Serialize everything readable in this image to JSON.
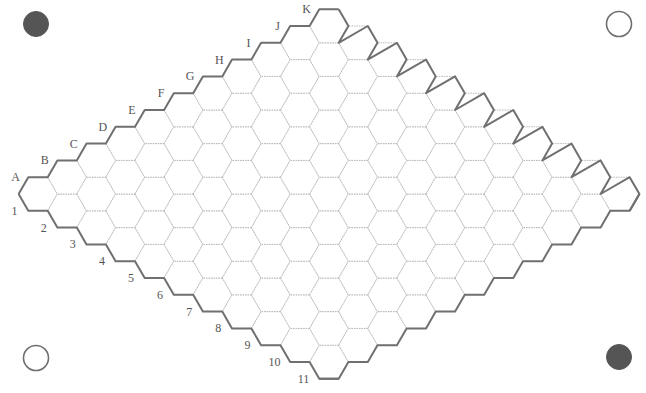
{
  "game": "Hex",
  "board": {
    "size": 11,
    "letters": [
      "A",
      "B",
      "C",
      "D",
      "E",
      "F",
      "G",
      "H",
      "I",
      "J",
      "K"
    ],
    "numbers": [
      "1",
      "2",
      "3",
      "4",
      "5",
      "6",
      "7",
      "8",
      "9",
      "10",
      "11"
    ],
    "cell_fill": "#ffffff",
    "grid_color": "#b8b8b8",
    "edge_color": "#707070",
    "label_color": "#555555"
  },
  "corner_markers": [
    {
      "position": "top-left",
      "type": "filled",
      "color": "#555555"
    },
    {
      "position": "top-right",
      "type": "hollow",
      "color": "#707070"
    },
    {
      "position": "bottom-left",
      "type": "hollow",
      "color": "#707070"
    },
    {
      "position": "bottom-right",
      "type": "filled",
      "color": "#555555"
    }
  ]
}
